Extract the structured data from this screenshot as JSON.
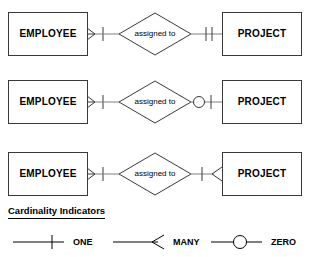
{
  "diagram": {
    "title_text": "Cardinality Indicators",
    "line_color": "#3a3a3a",
    "text_color": "#000000",
    "background": "#ffffff",
    "rows": [
      {
        "left_entity": "EMPLOYEE",
        "relationship": "assigned to",
        "right_entity": "PROJECT",
        "left_cardinality": "many-one",
        "right_cardinality": "one-one"
      },
      {
        "left_entity": "EMPLOYEE",
        "relationship": "assigned to",
        "right_entity": "PROJECT",
        "left_cardinality": "many-one",
        "right_cardinality": "zero-one"
      },
      {
        "left_entity": "EMPLOYEE",
        "relationship": "assigned to",
        "right_entity": "PROJECT",
        "left_cardinality": "many-one",
        "right_cardinality": "one-many"
      }
    ]
  },
  "legend": {
    "title": "Cardinality Indicators",
    "items": [
      {
        "label": "ONE",
        "symbol": "one-tick-icon"
      },
      {
        "label": "MANY",
        "symbol": "crows-foot-icon"
      },
      {
        "label": "ZERO",
        "symbol": "circle-icon"
      }
    ]
  }
}
